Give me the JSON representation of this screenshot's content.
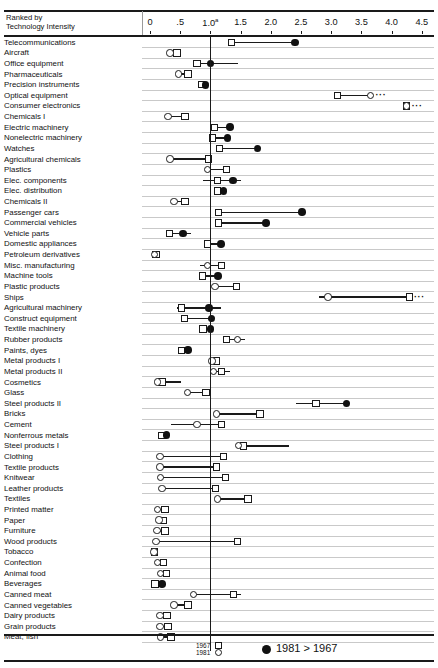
{
  "top_clipped_text": "",
  "header": {
    "rank_line1": "Ranked by",
    "rank_line2": "Technology Intensity"
  },
  "legend": {
    "year_old": "1967",
    "year_new": "1981",
    "note": "1981 > 1967",
    "old_marker": "square",
    "new_marker": "circle",
    "note_marker": "filled-circle"
  },
  "chart_data": {
    "type": "scatter",
    "title": "",
    "subtitle": "",
    "xlabel": "",
    "ylabel": "Ranked by Technology Intensity",
    "xlim": [
      0,
      4.6
    ],
    "grid": true,
    "legend_position": "bottom",
    "reference_line": 1.0,
    "axis_ticks": [
      {
        "value": 0,
        "label": "0"
      },
      {
        "value": 0.5,
        "label": ".5"
      },
      {
        "value": 1.0,
        "label": "1.0",
        "sup": "a"
      },
      {
        "value": 1.5,
        "label": "1.5"
      },
      {
        "value": 2.0,
        "label": "2.0"
      },
      {
        "value": 2.5,
        "label": "2.5"
      },
      {
        "value": 3.0,
        "label": "3.0"
      },
      {
        "value": 3.5,
        "label": "3.5"
      },
      {
        "value": 4.0,
        "label": "4.0"
      },
      {
        "value": 4.5,
        "label": "4.5"
      }
    ],
    "series": [
      {
        "name": "1967",
        "marker": "square"
      },
      {
        "name": "1981",
        "marker": "circle"
      },
      {
        "name": "1981 > 1967",
        "marker": "filled-circle"
      }
    ],
    "categories": [
      "Telecommunications",
      "Aircraft",
      "Office equipment",
      "Pharmaceuticals",
      "Precision instruments",
      "Optical equipment",
      "Consumer electronics",
      "Chemicals I",
      "Electric machinery",
      "Nonelectric machinery",
      "Watches",
      "Agricultural chemicals",
      "Plastics",
      "Elec. components",
      "Elec. distribution",
      "Chemicals II",
      "Passenger cars",
      "Commercial vehicles",
      "Vehicle parts",
      "Domestic appliances",
      "Petroleum derivatives",
      "Misc. manufacturing",
      "Machine tools",
      "Plastic products",
      "Ships",
      "Agricultural machinery",
      "Construct equipment",
      "Textile machinery",
      "Rubber products",
      "Paints, dyes",
      "Metal products I",
      "Metal products II",
      "Cosmetics",
      "Glass",
      "Steel products II",
      "Bricks",
      "Cement",
      "Nonferrous metals",
      "Steel products I",
      "Clothing",
      "Textile products",
      "Knitwear",
      "Leather products",
      "Textiles",
      "Printed matter",
      "Paper",
      "Furniture",
      "Wood products",
      "Tobacco",
      "Confection",
      "Animal food",
      "Beverages",
      "Canned meat",
      "Canned vegetables",
      "Dairy products",
      "Grain products",
      "Meat, fish"
    ],
    "rows": [
      {
        "category": "Telecommunications",
        "v1967": 1.35,
        "v1981": 2.4,
        "new_greater": true,
        "line": [
          1.35,
          2.4
        ],
        "offscale": false
      },
      {
        "category": "Aircraft",
        "v1967": 0.45,
        "v1981": 0.33,
        "new_greater": false,
        "line": [
          0.33,
          0.45
        ],
        "offscale": false
      },
      {
        "category": "Office equipment",
        "v1967": 0.78,
        "v1981": 1.0,
        "new_greater": true,
        "line": [
          0.78,
          1.45
        ],
        "offscale": false
      },
      {
        "category": "Pharmaceuticals",
        "v1967": 0.63,
        "v1981": 0.47,
        "new_greater": false,
        "line": [
          0.47,
          0.63
        ],
        "offscale": false
      },
      {
        "category": "Precision instruments",
        "v1967": 0.85,
        "v1981": 0.92,
        "new_greater": true,
        "line": [
          0.8,
          0.92
        ],
        "offscale": false
      },
      {
        "category": "Optical equipment",
        "v1967": 3.1,
        "v1981": 3.65,
        "new_greater": false,
        "line": [
          3.1,
          3.65
        ],
        "offscale": true
      },
      {
        "category": "Consumer electronics",
        "v1967": 4.25,
        "v1981": 4.25,
        "new_greater": false,
        "line": null,
        "offscale": true
      },
      {
        "category": "Chemicals I",
        "v1967": 0.58,
        "v1981": 0.3,
        "new_greater": false,
        "line": [
          0.3,
          0.58
        ],
        "offscale": false
      },
      {
        "category": "Electric machinery",
        "v1967": 1.07,
        "v1981": 1.32,
        "new_greater": true,
        "line": [
          1.07,
          1.32
        ],
        "offscale": false
      },
      {
        "category": "Nonelectric machinery",
        "v1967": 1.03,
        "v1981": 1.28,
        "new_greater": true,
        "line": [
          1.03,
          1.28
        ],
        "offscale": false
      },
      {
        "category": "Watches",
        "v1967": 1.15,
        "v1981": 1.78,
        "new_greater": true,
        "line": [
          1.15,
          1.78
        ],
        "offscale": false
      },
      {
        "category": "Agricultural chemicals",
        "v1967": 0.97,
        "v1981": 0.33,
        "new_greater": false,
        "line": [
          0.33,
          0.97
        ],
        "offscale": false
      },
      {
        "category": "Plastics",
        "v1967": 1.27,
        "v1981": 0.95,
        "new_greater": false,
        "line": [
          0.95,
          1.27
        ],
        "offscale": false
      },
      {
        "category": "Elec. components",
        "v1967": 1.12,
        "v1981": 1.37,
        "new_greater": true,
        "line": [
          0.88,
          1.5
        ],
        "offscale": false
      },
      {
        "category": "Elec. distribution",
        "v1967": 1.12,
        "v1981": 1.22,
        "new_greater": true,
        "line": [
          1.12,
          1.22
        ],
        "offscale": false
      },
      {
        "category": "Chemicals II",
        "v1967": 0.58,
        "v1981": 0.4,
        "new_greater": false,
        "line": [
          0.4,
          0.62
        ],
        "offscale": false
      },
      {
        "category": "Passenger cars",
        "v1967": 1.13,
        "v1981": 2.52,
        "new_greater": true,
        "line": [
          1.13,
          2.52
        ],
        "offscale": false
      },
      {
        "category": "Commercial vehicles",
        "v1967": 1.13,
        "v1981": 1.92,
        "new_greater": true,
        "line": [
          1.13,
          1.92
        ],
        "offscale": false
      },
      {
        "category": "Vehicle parts",
        "v1967": 0.32,
        "v1981": 0.55,
        "new_greater": true,
        "line": [
          0.32,
          0.68
        ],
        "offscale": false
      },
      {
        "category": "Domestic appliances",
        "v1967": 0.95,
        "v1981": 1.18,
        "new_greater": true,
        "line": [
          0.95,
          1.18
        ],
        "offscale": false
      },
      {
        "category": "Petroleum derivatives",
        "v1967": 0.1,
        "v1981": 0.08,
        "new_greater": false,
        "line": [
          0.07,
          0.14
        ],
        "offscale": false
      },
      {
        "category": "Misc. manufacturing",
        "v1967": 1.18,
        "v1981": 0.95,
        "new_greater": false,
        "line": [
          0.82,
          1.18
        ],
        "offscale": false
      },
      {
        "category": "Machine tools",
        "v1967": 0.87,
        "v1981": 1.13,
        "new_greater": true,
        "line": [
          0.87,
          1.13
        ],
        "offscale": false
      },
      {
        "category": "Plastic products",
        "v1967": 1.43,
        "v1981": 1.08,
        "new_greater": false,
        "line": [
          1.08,
          1.43
        ],
        "offscale": false
      },
      {
        "category": "Ships",
        "v1967": 4.3,
        "v1981": 2.95,
        "new_greater": false,
        "line": [
          2.8,
          4.3
        ],
        "offscale": true
      },
      {
        "category": "Agricultural machinery",
        "v1967": 0.52,
        "v1981": 0.98,
        "new_greater": true,
        "line": [
          0.45,
          1.18
        ],
        "offscale": false
      },
      {
        "category": "Construct equipment",
        "v1967": 0.57,
        "v1981": 1.02,
        "new_greater": true,
        "line": [
          0.57,
          1.02
        ],
        "offscale": false
      },
      {
        "category": "Textile machinery",
        "v1967": 0.88,
        "v1981": 1.0,
        "new_greater": true,
        "line": [
          0.88,
          1.0
        ],
        "offscale": false
      },
      {
        "category": "Rubber products",
        "v1967": 1.27,
        "v1981": 1.45,
        "new_greater": false,
        "line": [
          1.27,
          1.58
        ],
        "offscale": false
      },
      {
        "category": "Paints, dyes",
        "v1967": 0.52,
        "v1981": 0.63,
        "new_greater": true,
        "line": [
          0.52,
          0.7
        ],
        "offscale": false
      },
      {
        "category": "Metal products I",
        "v1967": 1.1,
        "v1981": 1.03,
        "new_greater": false,
        "line": [
          1.03,
          1.13
        ],
        "offscale": false
      },
      {
        "category": "Metal products II",
        "v1967": 1.18,
        "v1981": 1.05,
        "new_greater": false,
        "line": [
          1.05,
          1.33
        ],
        "offscale": false
      },
      {
        "category": "Cosmetics",
        "v1967": 0.2,
        "v1981": 0.13,
        "new_greater": false,
        "line": [
          0.13,
          0.52
        ],
        "offscale": false
      },
      {
        "category": "Glass",
        "v1967": 0.93,
        "v1981": 0.62,
        "new_greater": false,
        "line": [
          0.62,
          0.93
        ],
        "offscale": false
      },
      {
        "category": "Steel products II",
        "v1967": 2.75,
        "v1981": 3.25,
        "new_greater": true,
        "line": [
          2.42,
          3.25
        ],
        "offscale": false
      },
      {
        "category": "Bricks",
        "v1967": 1.82,
        "v1981": 1.1,
        "new_greater": false,
        "line": [
          1.1,
          1.82
        ],
        "offscale": false
      },
      {
        "category": "Cement",
        "v1967": 1.18,
        "v1981": 0.78,
        "new_greater": false,
        "line": [
          0.35,
          1.18
        ],
        "offscale": false
      },
      {
        "category": "Nonferrous metals",
        "v1967": 0.2,
        "v1981": 0.27,
        "new_greater": true,
        "line": [
          0.18,
          0.32
        ],
        "offscale": false
      },
      {
        "category": "Steel products I",
        "v1967": 1.55,
        "v1981": 1.47,
        "new_greater": false,
        "line": [
          1.47,
          2.3
        ],
        "offscale": false
      },
      {
        "category": "Clothing",
        "v1967": 1.22,
        "v1981": 0.17,
        "new_greater": false,
        "line": [
          0.17,
          1.22
        ],
        "offscale": false
      },
      {
        "category": "Textile products",
        "v1967": 1.1,
        "v1981": 0.17,
        "new_greater": false,
        "line": [
          0.17,
          1.1
        ],
        "offscale": false
      },
      {
        "category": "Knitwear",
        "v1967": 1.25,
        "v1981": 0.18,
        "new_greater": false,
        "line": [
          0.18,
          1.25
        ],
        "offscale": false
      },
      {
        "category": "Leather products",
        "v1967": 1.08,
        "v1981": 0.2,
        "new_greater": false,
        "line": [
          0.2,
          1.08
        ],
        "offscale": false
      },
      {
        "category": "Textiles",
        "v1967": 1.62,
        "v1981": 1.12,
        "new_greater": false,
        "line": [
          1.12,
          1.62
        ],
        "offscale": false
      },
      {
        "category": "Printed matter",
        "v1967": 0.25,
        "v1981": 0.13,
        "new_greater": false,
        "line": [
          0.1,
          0.3
        ],
        "offscale": false
      },
      {
        "category": "Paper",
        "v1967": 0.22,
        "v1981": 0.15,
        "new_greater": false,
        "line": [
          0.12,
          0.27
        ],
        "offscale": false
      },
      {
        "category": "Furniture",
        "v1967": 0.25,
        "v1981": 0.12,
        "new_greater": false,
        "line": [
          0.12,
          0.25
        ],
        "offscale": false
      },
      {
        "category": "Wood products",
        "v1967": 1.45,
        "v1981": 0.1,
        "new_greater": false,
        "line": [
          0.1,
          1.45
        ],
        "offscale": false
      },
      {
        "category": "Tobacco",
        "v1967": 0.07,
        "v1981": 0.07,
        "new_greater": false,
        "line": null,
        "offscale": false
      },
      {
        "category": "Confection",
        "v1967": 0.22,
        "v1981": 0.13,
        "new_greater": false,
        "line": [
          0.13,
          0.22
        ],
        "offscale": false
      },
      {
        "category": "Animal food",
        "v1967": 0.27,
        "v1981": 0.18,
        "new_greater": false,
        "line": [
          0.18,
          0.27
        ],
        "offscale": false
      },
      {
        "category": "Beverages",
        "v1967": 0.08,
        "v1981": 0.2,
        "new_greater": true,
        "line": [
          0.05,
          0.22
        ],
        "offscale": false
      },
      {
        "category": "Canned meat",
        "v1967": 1.38,
        "v1981": 0.72,
        "new_greater": false,
        "line": [
          0.72,
          1.5
        ],
        "offscale": false
      },
      {
        "category": "Canned vegetables",
        "v1967": 0.63,
        "v1981": 0.4,
        "new_greater": false,
        "line": [
          0.4,
          0.63
        ],
        "offscale": false
      },
      {
        "category": "Dairy products",
        "v1967": 0.28,
        "v1981": 0.17,
        "new_greater": false,
        "line": [
          0.17,
          0.28
        ],
        "offscale": false
      },
      {
        "category": "Grain products",
        "v1967": 0.3,
        "v1981": 0.17,
        "new_greater": false,
        "line": [
          0.17,
          0.3
        ],
        "offscale": false
      },
      {
        "category": "Meat, fish",
        "v1967": 0.35,
        "v1981": 0.18,
        "new_greater": false,
        "line": [
          0.18,
          0.35
        ],
        "offscale": false
      }
    ]
  }
}
